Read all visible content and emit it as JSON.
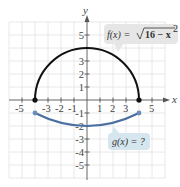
{
  "figure": {
    "label": "c",
    "axes": {
      "x_label": "x",
      "y_label": "y",
      "x_ticks": [
        "-5",
        "-3",
        "-2",
        "-1",
        "1",
        "2",
        "3",
        "5"
      ],
      "y_ticks_pos": [
        "5",
        "3",
        "2",
        "1"
      ],
      "y_ticks_neg": [
        "-1",
        "-2",
        "-3",
        "-4",
        "-5"
      ]
    },
    "curves": {
      "f": {
        "equation": "f(x) = √(16 − x²)",
        "color": "#111111"
      },
      "g": {
        "equation": "g(x) = ?",
        "color": "#4a6fa0"
      }
    },
    "callouts": {
      "f_prefix": "f(x) = ",
      "f_radical": "16 − x",
      "f_exp": "2",
      "g_text": "g(x) = ?",
      "f_bg": "#e6e6e6",
      "g_bg": "#d6e6ee"
    }
  }
}
